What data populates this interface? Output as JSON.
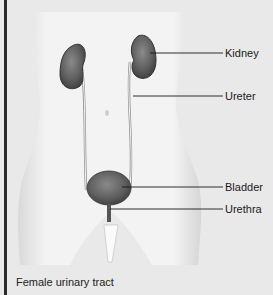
{
  "figure": {
    "caption": "Female urinary tract",
    "labels": [
      {
        "text": "Kidney",
        "x": 225,
        "y": 47
      },
      {
        "text": "Ureter",
        "x": 225,
        "y": 90
      },
      {
        "text": "Bladder",
        "x": 225,
        "y": 181
      },
      {
        "text": "Urethra",
        "x": 225,
        "y": 203
      }
    ]
  },
  "colors": {
    "background": "#e9e9e9",
    "torso": "#f1f1f1",
    "organ": "#5e5e5e",
    "organ_outline": "#333333",
    "leader_line": "#1a1a1a"
  }
}
